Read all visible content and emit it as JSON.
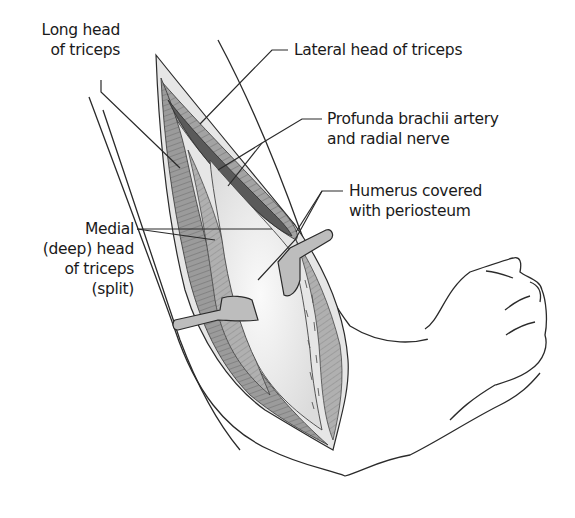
{
  "figure": {
    "colors": {
      "line": "#2a2a2a",
      "muscle": "#9a9a9a",
      "muscle_dark": "#6e6e6e",
      "muscle_light": "#c4c4c4",
      "bone": "#eeeeee",
      "retractor": "#bdbdbd",
      "skin": "#ffffff"
    }
  },
  "labels": {
    "long_head": {
      "line1": "Long head",
      "line2": "of triceps"
    },
    "lateral_head": {
      "line1": "Lateral head of triceps"
    },
    "profunda": {
      "line1": "Profunda brachii artery",
      "line2": "and radial nerve"
    },
    "humerus": {
      "line1": "Humerus covered",
      "line2": "with periosteum"
    },
    "medial_head": {
      "line1": "Medial",
      "line2": "(deep) head",
      "line3": "of triceps",
      "line4": "(split)"
    }
  }
}
